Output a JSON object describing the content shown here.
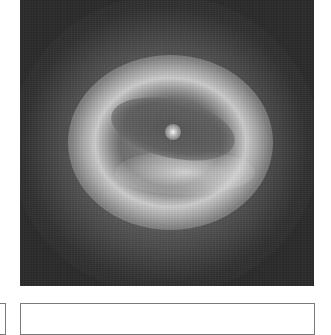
{
  "image": {
    "subject": "galaxy with dark dust ring and bright central core",
    "colormap": "grayscale",
    "colors": {
      "background": "#2b2b2b",
      "ring": "#e1e1e1",
      "dust_lane": "#555555",
      "core": "#ffffff"
    }
  },
  "panels": {
    "left": {
      "label": ""
    },
    "main": {
      "label": ""
    }
  }
}
